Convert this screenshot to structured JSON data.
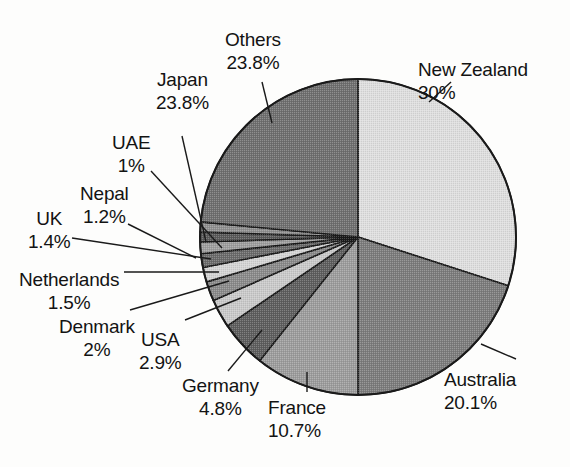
{
  "figure": {
    "background_color": "#fdfdfc",
    "outline_color": "#1a1a1a",
    "text_color": "#131313"
  },
  "chart_data": {
    "type": "pie",
    "title": "",
    "subtitle": "",
    "xlabel": "",
    "ylabel": "",
    "legend_position": "none",
    "grid": false,
    "labels_outside": true,
    "leader_lines": true,
    "start_angle_deg": 0,
    "direction": "clockwise",
    "units": "percent",
    "categories": [
      "New Zealand",
      "Australia",
      "France",
      "Germany",
      "USA",
      "Denmark",
      "Netherlands",
      "UK",
      "Nepal",
      "UAE",
      "Japan",
      "Others"
    ],
    "values": [
      30,
      20.1,
      10.7,
      4.8,
      2.9,
      2,
      1.5,
      1.4,
      1.2,
      1,
      23.8,
      23.8
    ],
    "value_labels": [
      "30%",
      "20.1%",
      "10.7%",
      "4.8%",
      "2.9%",
      "2%",
      "1.5%",
      "1.4%",
      "1.2%",
      "1%",
      "23.8%",
      "23.8%"
    ],
    "slice_fills": [
      "#dedede",
      "#7c7c7c",
      "#9c9c9c",
      "#5e5e5e",
      "#c9c9c9",
      "#8a8a8a",
      "#d4d4d4",
      "#6b6b6b",
      "#9e9e9e",
      "#5a5a5a",
      "#8f8f8f",
      "#6f6f6f"
    ]
  },
  "slices": [
    {
      "name": "New Zealand",
      "percent_label": "30%",
      "value": 30,
      "fill": "#dedede",
      "label_x": 418,
      "label_y": 58,
      "align": "left"
    },
    {
      "name": "Australia",
      "percent_label": "20.1%",
      "value": 20.1,
      "fill": "#7c7c7c",
      "label_x": 444,
      "label_y": 368,
      "align": "left"
    },
    {
      "name": "France",
      "percent_label": "10.7%",
      "value": 10.7,
      "fill": "#9c9c9c",
      "label_x": 268,
      "label_y": 396,
      "align": "left"
    },
    {
      "name": "Germany",
      "percent_label": "4.8%",
      "value": 4.8,
      "fill": "#5e5e5e",
      "label_x": 182,
      "label_y": 374,
      "align": "center"
    },
    {
      "name": "USA",
      "percent_label": "2.9%",
      "value": 2.9,
      "fill": "#c9c9c9",
      "label_x": 139,
      "label_y": 328,
      "align": "center"
    },
    {
      "name": "Denmark",
      "percent_label": "2%",
      "value": 2,
      "fill": "#8a8a8a",
      "label_x": 59,
      "label_y": 315,
      "align": "center"
    },
    {
      "name": "Netherlands",
      "percent_label": "1.5%",
      "value": 1.5,
      "fill": "#d4d4d4",
      "label_x": 19,
      "label_y": 268,
      "align": "center"
    },
    {
      "name": "UK",
      "percent_label": "1.4%",
      "value": 1.4,
      "fill": "#6b6b6b",
      "label_x": 28,
      "label_y": 207,
      "align": "center"
    },
    {
      "name": "Nepal",
      "percent_label": "1.2%",
      "value": 1.2,
      "fill": "#9e9e9e",
      "label_x": 80,
      "label_y": 182,
      "align": "center"
    },
    {
      "name": "UAE",
      "percent_label": "1%",
      "value": 1,
      "fill": "#5a5a5a",
      "label_x": 112,
      "label_y": 131,
      "align": "center"
    },
    {
      "name": "Japan",
      "percent_label": "23.8%",
      "value": 23.8,
      "fill": "#8f8f8f",
      "label_x": 156,
      "label_y": 68,
      "align": "center"
    },
    {
      "name": "Others",
      "percent_label": "23.8%",
      "value": 23.8,
      "fill": "#6f6f6f",
      "label_x": 225,
      "label_y": 28,
      "align": "center"
    }
  ],
  "geometry": {
    "center_x": 358,
    "center_y": 237,
    "radius": 158,
    "wedges": [
      {
        "name": "New Zealand",
        "start_deg": 0,
        "end_deg": 108,
        "fill": "#dedede"
      },
      {
        "name": "Australia",
        "start_deg": 108,
        "end_deg": 180,
        "fill": "#7c7c7c"
      },
      {
        "name": "France",
        "start_deg": 180,
        "end_deg": 218.5,
        "fill": "#9c9c9c"
      },
      {
        "name": "Germany",
        "start_deg": 218.5,
        "end_deg": 235.8,
        "fill": "#5e5e5e"
      },
      {
        "name": "USA",
        "start_deg": 235.8,
        "end_deg": 246.3,
        "fill": "#c9c9c9"
      },
      {
        "name": "Denmark",
        "start_deg": 246.3,
        "end_deg": 253.5,
        "fill": "#8a8a8a"
      },
      {
        "name": "Netherlands",
        "start_deg": 253.5,
        "end_deg": 258.9,
        "fill": "#d4d4d4"
      },
      {
        "name": "UK",
        "start_deg": 258.9,
        "end_deg": 263.9,
        "fill": "#6b6b6b"
      },
      {
        "name": "Nepal",
        "start_deg": 263.9,
        "end_deg": 268.2,
        "fill": "#9e9e9e"
      },
      {
        "name": "UAE",
        "start_deg": 268.2,
        "end_deg": 271.8,
        "fill": "#5a5a5a"
      },
      {
        "name": "Japan",
        "start_deg": 271.8,
        "end_deg": 275.5,
        "fill": "#8f8f8f"
      },
      {
        "name": "Others",
        "start_deg": 275.5,
        "end_deg": 360,
        "fill": "#6f6f6f"
      }
    ],
    "leaders": [
      {
        "name": "New Zealand",
        "points": "429,102 451,82"
      },
      {
        "name": "Australia",
        "points": "481,344 516,359"
      },
      {
        "name": "France",
        "points": "307,392 307,372"
      },
      {
        "name": "Germany",
        "points": "228,371 262,330"
      },
      {
        "name": "USA",
        "points": "185,320 241,298"
      },
      {
        "name": "Denmark",
        "points": "130,310 229,281"
      },
      {
        "name": "Netherlands",
        "points": "124,272 219,272"
      },
      {
        "name": "UK",
        "points": "72,238 211,259"
      },
      {
        "name": "Nepal",
        "points": "128,224 196,258"
      },
      {
        "name": "UAE",
        "points": "151,171 222,248"
      },
      {
        "name": "Japan",
        "points": "182,136 206,242"
      },
      {
        "name": "Others",
        "points": "262,82 272,123"
      }
    ]
  }
}
